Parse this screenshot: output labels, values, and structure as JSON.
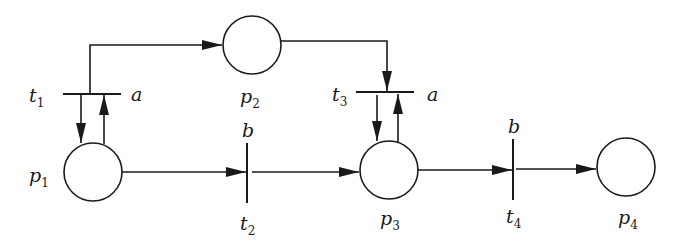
{
  "diagram": {
    "type": "petri-net",
    "colors": {
      "stroke": "#1a1a1a",
      "background": "#ffffff"
    },
    "places": [
      {
        "id": "p1",
        "name": "p",
        "sub": "1",
        "cx": 93,
        "cy": 172,
        "r": 29
      },
      {
        "id": "p2",
        "name": "p",
        "sub": "2",
        "cx": 252,
        "cy": 45,
        "r": 29
      },
      {
        "id": "p3",
        "name": "p",
        "sub": "3",
        "cx": 389,
        "cy": 170,
        "r": 29
      },
      {
        "id": "p4",
        "name": "p",
        "sub": "4",
        "cx": 626,
        "cy": 167,
        "r": 29
      }
    ],
    "transitions": [
      {
        "id": "t1",
        "name": "t",
        "sub": "1",
        "action": "a",
        "orientation": "horizontal"
      },
      {
        "id": "t2",
        "name": "t",
        "sub": "2",
        "action": "b",
        "orientation": "vertical"
      },
      {
        "id": "t3",
        "name": "t",
        "sub": "3",
        "action": "a",
        "orientation": "horizontal"
      },
      {
        "id": "t4",
        "name": "t",
        "sub": "4",
        "action": "b",
        "orientation": "vertical"
      }
    ],
    "arcs": [
      {
        "from": "t1",
        "to": "p2"
      },
      {
        "from": "t1",
        "to": "p1"
      },
      {
        "from": "p1",
        "to": "t1"
      },
      {
        "from": "p1",
        "to": "t2"
      },
      {
        "from": "t2",
        "to": "p3"
      },
      {
        "from": "p2",
        "to": "t3"
      },
      {
        "from": "t3",
        "to": "p3"
      },
      {
        "from": "p3",
        "to": "t3"
      },
      {
        "from": "p3",
        "to": "t4"
      },
      {
        "from": "t4",
        "to": "p4"
      }
    ]
  }
}
